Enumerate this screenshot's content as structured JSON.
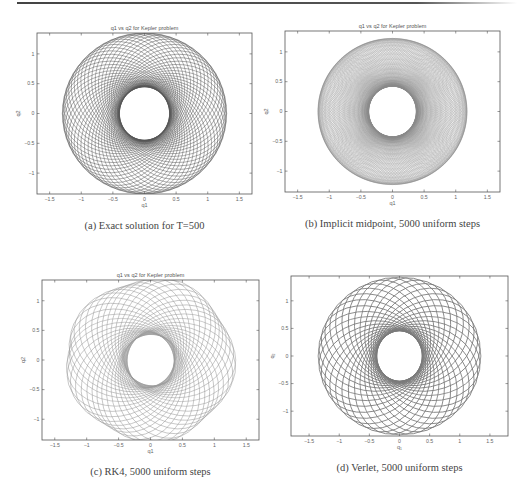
{
  "figure": {
    "panels": [
      {
        "id": "a",
        "title": "q1 vs q2 for Kepler problem",
        "xlabel": "q1",
        "ylabel": "q2",
        "caption": "(a) Exact solution for T=500",
        "frame": {
          "left": 37,
          "top": 33,
          "right": 252,
          "bottom": 194
        },
        "xlim": [
          -1.7,
          1.7
        ],
        "ylim": [
          -1.35,
          1.35
        ],
        "xticks": [
          "-1.5",
          "-1",
          "-0.5",
          "0",
          "0.5",
          "1",
          "1.5"
        ],
        "yticks": [
          "1",
          "0.5",
          "0",
          "-0.5",
          "-1"
        ],
        "stroke": "#555555",
        "stroke_width": 0.45,
        "orbits": 60,
        "drift": 0.0,
        "show_title": true
      },
      {
        "id": "b",
        "title": "q1 vs q2 for Kepler problem",
        "xlabel": "q1",
        "ylabel": "q2",
        "caption": "(b) Implicit midpoint, 5000 uniform steps",
        "frame": {
          "left": 285,
          "top": 31,
          "right": 500,
          "bottom": 192
        },
        "xlim": [
          -1.7,
          1.7
        ],
        "ylim": [
          -1.35,
          1.35
        ],
        "xticks": [
          "-1.5",
          "-1",
          "-0.5",
          "0",
          "0.5",
          "1",
          "1.5"
        ],
        "yticks": [
          "1",
          "0.5",
          "0",
          "-0.5",
          "-1"
        ],
        "stroke": "#8a8a8a",
        "stroke_width": 0.3,
        "orbits": 140,
        "drift": 0.0,
        "show_title": true
      },
      {
        "id": "c",
        "title": "q1 vs q2 for Kepler problem",
        "xlabel": "q1",
        "ylabel": "q2",
        "caption": "(c) RK4, 5000 uniform steps",
        "frame": {
          "left": 42,
          "top": 280,
          "right": 259,
          "bottom": 440
        },
        "xlim": [
          -1.7,
          1.7
        ],
        "ylim": [
          -1.35,
          1.35
        ],
        "xticks": [
          "-1.5",
          "-1",
          "-0.5",
          "0",
          "0.5",
          "1",
          "1.5"
        ],
        "yticks": [
          "1",
          "0.5",
          "0",
          "-0.5",
          "-1"
        ],
        "stroke": "#9a9a9a",
        "stroke_width": 0.5,
        "orbits": 42,
        "drift": 0.12,
        "show_title": true
      },
      {
        "id": "d",
        "title": "",
        "xlabel": "q₁",
        "ylabel": "q₂",
        "caption": "(d) Verlet, 5000 uniform steps",
        "frame": {
          "left": 291,
          "top": 276,
          "right": 508,
          "bottom": 436
        },
        "xlim": [
          -1.8,
          1.8
        ],
        "ylim": [
          -1.45,
          1.45
        ],
        "xticks": [
          "-1.5",
          "-1",
          "-0.5",
          "0",
          "0.5",
          "1",
          "1.5"
        ],
        "yticks": [
          "1",
          "0.5",
          "0",
          "-0.5",
          "-1"
        ],
        "stroke": "#7a7a7a",
        "stroke_width": 0.8,
        "orbits": 36,
        "drift": 0.0,
        "show_title": false
      }
    ]
  },
  "chart_data": [
    {
      "type": "line",
      "title": "q1 vs q2 for Kepler problem",
      "xlabel": "q1",
      "ylabel": "q2",
      "xlim": [
        -1.7,
        1.7
      ],
      "ylim": [
        -1.35,
        1.35
      ],
      "description": "Precessing elliptic orbits forming an annulus, inner radius ~0.4, outer radius ~1.3",
      "series": [
        {
          "name": "exact",
          "inner_radius": 0.4,
          "outer_radius": 1.3
        }
      ],
      "caption": "(a) Exact solution for T=500"
    },
    {
      "type": "line",
      "title": "q1 vs q2 for Kepler problem",
      "xlabel": "q1",
      "ylabel": "q2",
      "xlim": [
        -1.7,
        1.7
      ],
      "ylim": [
        -1.35,
        1.35
      ],
      "series": [
        {
          "name": "implicit midpoint",
          "inner_radius": 0.38,
          "outer_radius": 1.18
        }
      ],
      "caption": "(b) Implicit midpoint, 5000 uniform steps"
    },
    {
      "type": "line",
      "title": "q1 vs q2 for Kepler problem",
      "xlabel": "q1",
      "ylabel": "q2",
      "xlim": [
        -1.7,
        1.7
      ],
      "ylim": [
        -1.35,
        1.35
      ],
      "series": [
        {
          "name": "RK4",
          "inner_radius": 0.38,
          "outer_radius": 1.3
        }
      ],
      "caption": "(c) RK4, 5000 uniform steps"
    },
    {
      "type": "line",
      "title": "",
      "xlabel": "q1",
      "ylabel": "q2",
      "xlim": [
        -1.8,
        1.8
      ],
      "ylim": [
        -1.45,
        1.45
      ],
      "series": [
        {
          "name": "Verlet",
          "inner_radius": 0.38,
          "outer_radius": 1.35
        }
      ],
      "caption": "(d) Verlet, 5000 uniform steps"
    }
  ]
}
